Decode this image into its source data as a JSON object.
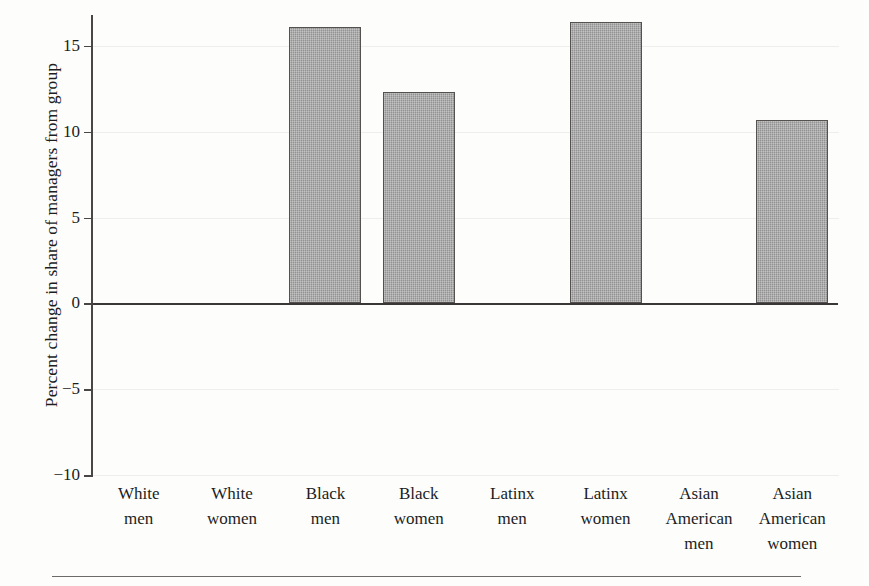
{
  "chart_data": {
    "type": "bar",
    "title": "",
    "subtitle": "",
    "xlabel": "",
    "ylabel": "Percent change in share of managers from group",
    "categories": [
      "White men",
      "White women",
      "Black men",
      "Black women",
      "Latinx men",
      "Latinx women",
      "Asian American men",
      "Asian American women"
    ],
    "category_lines": [
      [
        "White",
        "men"
      ],
      [
        "White",
        "women"
      ],
      [
        "Black",
        "men"
      ],
      [
        "Black",
        "women"
      ],
      [
        "Latinx",
        "men"
      ],
      [
        "Latinx",
        "women"
      ],
      [
        "Asian",
        "American",
        "men"
      ],
      [
        "Asian",
        "American",
        "women"
      ]
    ],
    "values": [
      0,
      0,
      16.1,
      12.3,
      0,
      16.4,
      0,
      10.7
    ],
    "ylim": [
      -10,
      16.8
    ],
    "yticks": [
      15,
      10,
      5,
      0,
      -5,
      -10
    ],
    "ytick_labels": [
      "15",
      "10",
      "5",
      "0",
      "−5",
      "−10"
    ],
    "grid": "horizontal-faint",
    "legend": "none",
    "bar_fill_color": "#9b9b9b",
    "bar_edge_color": "#55514f",
    "zero_line_color": "#3a3637",
    "background_color": "#fdfdfc",
    "text_color": "#231f20"
  }
}
